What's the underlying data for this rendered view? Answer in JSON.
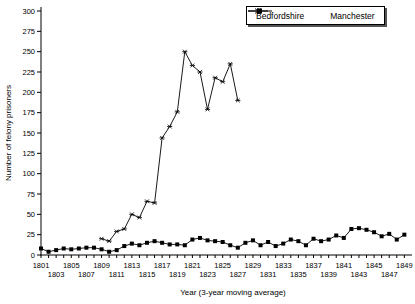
{
  "chart_data": {
    "type": "line",
    "title": "",
    "xlabel": "Year (3-year moving average)",
    "ylabel": "Number of felony prisoners",
    "x_start": 1801,
    "x_end": 1849,
    "xlabel_every": 2,
    "xlabel_rows": "staggered",
    "ylim": [
      0,
      300
    ],
    "ytick_step": 25,
    "grid": false,
    "legend_position": "top-right",
    "ink_color": "#000000",
    "background_color": "#ffffff",
    "series": [
      {
        "name": "Bedfordshire",
        "marker": "square",
        "color": "#000000",
        "x_start": 1801,
        "values": [
          8,
          4,
          6,
          8,
          7,
          8,
          9,
          9,
          7,
          4,
          6,
          11,
          14,
          12,
          15,
          17,
          15,
          13,
          13,
          12,
          19,
          21,
          18,
          17,
          16,
          12,
          9,
          15,
          18,
          12,
          16,
          11,
          14,
          19,
          17,
          12,
          20,
          17,
          19,
          24,
          21,
          32,
          33,
          31,
          28,
          23,
          26,
          19,
          25
        ]
      },
      {
        "name": "Manchester",
        "marker": "asterisk",
        "color": "#000000",
        "x_start": 1809,
        "values": [
          20,
          17,
          29,
          32,
          50,
          46,
          66,
          64,
          144,
          158,
          176,
          250,
          233,
          225,
          179,
          218,
          213,
          235,
          190
        ]
      }
    ]
  }
}
